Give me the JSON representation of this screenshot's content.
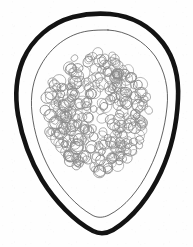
{
  "figure": {
    "title": "Egg with thick outer shell, inner membrane and internal cell cluster",
    "caption": "",
    "background_color": "#fefefe",
    "canvas": {
      "width": 193,
      "height": 247
    }
  },
  "structures": {
    "outer_shell": {
      "label": "outer shell",
      "stroke_color": "#131313",
      "stroke_width": 4.6,
      "fill": "none",
      "path": "M 110 14 C 131 16 150 26 163 43 C 175 59 179 79 178 99 C 177 122 172 148 161 172 C 150 196 133 218 113 230 C 106 234 99 234 93 231 C 74 221 55 201 42 180 C 30 160 22 137 18 115 C 15 97 16 77 23 60 C 32 39 51 23 73 17 C 85 14 98 13 110 14 Z"
    },
    "inner_membrane": {
      "label": "inner membrane",
      "stroke_color": "#3a3a3a",
      "stroke_width": 0.8,
      "fill": "none",
      "path": "M 108 30 C 127 31 144 41 155 56 C 165 71 169 89 167 107 C 165 128 159 150 149 170 C 139 190 125 207 109 215 C 103 218 97 218 92 215 C 76 206 61 189 50 170 C 40 152 34 132 32 113 C 30 96 33 79 41 65 C 51 47 68 34 88 31 C 95 30 101 30 108 30 Z"
    },
    "cell_cluster": {
      "label": "internal cell cluster",
      "stroke_color": "#8a8a8a",
      "stroke_width": 0.85,
      "fill": "none",
      "center_x": 97,
      "center_y": 112,
      "radius_x": 52,
      "radius_y": 60,
      "circle_count": 320,
      "circle_radius_min": 3.2,
      "circle_radius_max": 6.6
    }
  },
  "annotations": []
}
